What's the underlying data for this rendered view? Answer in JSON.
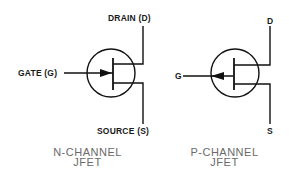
{
  "n_channel": {
    "drain_label": "DRAIN (D)",
    "gate_label": "GATE (G)",
    "source_label": "SOURCE (S)",
    "caption_line1": "N-CHANNEL",
    "caption_line2": "JFET",
    "arrow_direction": "inward"
  },
  "p_channel": {
    "drain_label": "D",
    "gate_label": "G",
    "source_label": "S",
    "caption_line1": "P-CHANNEL",
    "caption_line2": "JFET",
    "arrow_direction": "outward"
  },
  "colors": {
    "line": "#111111",
    "caption": "#6a6a6a"
  }
}
